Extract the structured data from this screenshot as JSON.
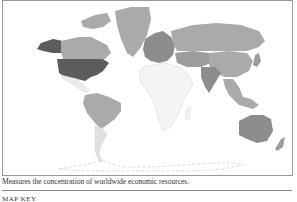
{
  "map": {
    "title": "World economic resources map",
    "caption": "Measures the concentration of worldwide economic resources.",
    "key_label": "MAP KEY",
    "colors": {
      "darkest": "#5c5c5c",
      "dark": "#8c8c8c",
      "medium": "#aaaaaa",
      "light": "#cfcfcf",
      "lightest": "#ececec",
      "outline": "#d6d6d6"
    },
    "regions": [
      {
        "name": "United States",
        "shade": "darkest"
      },
      {
        "name": "Alaska",
        "shade": "darkest"
      },
      {
        "name": "Canada",
        "shade": "medium"
      },
      {
        "name": "Greenland",
        "shade": "medium"
      },
      {
        "name": "Mexico",
        "shade": "lightest"
      },
      {
        "name": "Brazil",
        "shade": "medium"
      },
      {
        "name": "Argentina",
        "shade": "light"
      },
      {
        "name": "Europe",
        "shade": "dark"
      },
      {
        "name": "Russia",
        "shade": "medium"
      },
      {
        "name": "China",
        "shade": "medium"
      },
      {
        "name": "India",
        "shade": "dark"
      },
      {
        "name": "Africa",
        "shade": "lightest"
      },
      {
        "name": "Australia",
        "shade": "dark"
      },
      {
        "name": "Southeast Asia",
        "shade": "medium"
      }
    ]
  }
}
